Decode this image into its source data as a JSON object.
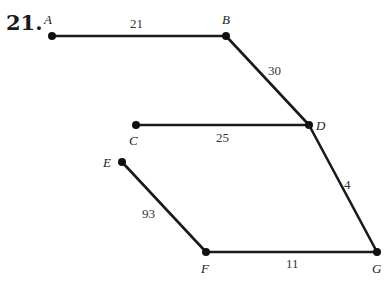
{
  "problem_number": "21.",
  "nodes": [
    {
      "id": "A",
      "label": "A",
      "x": 52,
      "y": 36,
      "lx": 44,
      "ly": 24
    },
    {
      "id": "B",
      "label": "B",
      "x": 226,
      "y": 36,
      "lx": 222,
      "ly": 24
    },
    {
      "id": "C",
      "label": "C",
      "x": 136,
      "y": 125,
      "lx": 129,
      "ly": 145
    },
    {
      "id": "D",
      "label": "D",
      "x": 309,
      "y": 125,
      "lx": 316,
      "ly": 130
    },
    {
      "id": "E",
      "label": "E",
      "x": 122,
      "y": 162,
      "lx": 103,
      "ly": 167
    },
    {
      "id": "F",
      "label": "F",
      "x": 206,
      "y": 252,
      "lx": 201,
      "ly": 273
    },
    {
      "id": "G",
      "label": "G",
      "x": 377,
      "y": 252,
      "lx": 372,
      "ly": 273
    }
  ],
  "edges": [
    {
      "from": "A",
      "to": "B",
      "weight": "21",
      "wx": 130,
      "wy": 28
    },
    {
      "from": "B",
      "to": "D",
      "weight": "30",
      "wx": 268,
      "wy": 75
    },
    {
      "from": "C",
      "to": "D",
      "weight": "25",
      "wx": 216,
      "wy": 142
    },
    {
      "from": "D",
      "to": "G",
      "weight": "4",
      "wx": 344,
      "wy": 189
    },
    {
      "from": "E",
      "to": "F",
      "weight": "93",
      "wx": 142,
      "wy": 218
    },
    {
      "from": "F",
      "to": "G",
      "weight": "11",
      "wx": 286,
      "wy": 268
    }
  ],
  "colors": {
    "ink": "#1a1a1a",
    "background": "#ffffff"
  }
}
